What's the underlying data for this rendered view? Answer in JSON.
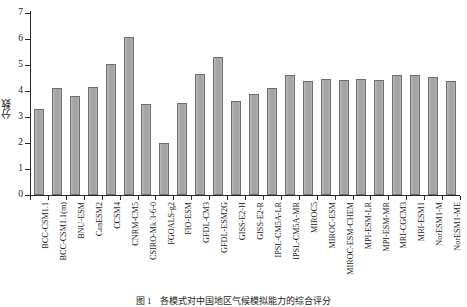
{
  "chart_data": {
    "type": "bar",
    "title": "",
    "xlabel": "",
    "ylabel": "分数",
    "ylim": [
      0,
      7
    ],
    "yticks": [
      0,
      1,
      2,
      3,
      4,
      5,
      6,
      7
    ],
    "grid": false,
    "legend": null,
    "bar_color": "#a9a9a9",
    "bar_edge_color": "#6e6e6e",
    "axis_color": "#2b2b2b",
    "categories": [
      "BCC-CSM1.1",
      "BCC-CSM1.1(m)",
      "BNU-ESM",
      "CanESM2",
      "CCSM4",
      "CNRM-CM5",
      "CSIRO-Mk 3-6-0",
      "FGOALS-g2",
      "FIO-ESM",
      "GFDL-CM3",
      "GFDL-ESM2G",
      "GISS-E2-H",
      "GISS-E2-R",
      "IPSL-CM5A-LR",
      "IPSL-CM5A-MR",
      "MIROC5",
      "MIROC-ESM",
      "MIROC-ESM-CHEM",
      "MPI-ESM-LR",
      "MPI-ESM-MR",
      "MRI-CGCM3",
      "MRI-ESM1",
      "NorESM1-M",
      "NorESM1-ME"
    ],
    "values": [
      3.3,
      4.13,
      3.8,
      4.15,
      5.05,
      6.08,
      3.5,
      2.0,
      3.55,
      4.67,
      5.3,
      3.62,
      3.88,
      4.1,
      4.62,
      4.4,
      4.48,
      4.44,
      4.46,
      4.43,
      4.6,
      4.63,
      4.53,
      4.4
    ]
  },
  "caption": {
    "text": "图 1　各模式对中国地区气候模拟能力的综合评分"
  }
}
